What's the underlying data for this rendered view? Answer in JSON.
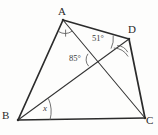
{
  "figure": {
    "kind": "quadrilateral-with-diagonals",
    "background_color": "#fdfdfc",
    "stroke_color": "#2b2b2b",
    "arc_color": "#555555",
    "vertices": [
      {
        "name": "A",
        "label": "A",
        "x": 63,
        "y": 20,
        "label_x": 58,
        "label_y": 6
      },
      {
        "name": "B",
        "label": "B",
        "x": 18,
        "y": 120,
        "label_x": 2,
        "label_y": 110
      },
      {
        "name": "C",
        "label": "C",
        "x": 145,
        "y": 118,
        "label_x": 146,
        "label_y": 115
      },
      {
        "name": "D",
        "label": "D",
        "x": 129,
        "y": 39,
        "label_x": 128,
        "label_y": 24
      }
    ],
    "sides": [
      {
        "name": "side-AB",
        "from": "A",
        "to": "B",
        "width": 1.6
      },
      {
        "name": "side-AD",
        "from": "A",
        "to": "D",
        "width": 1.6
      },
      {
        "name": "side-DC",
        "from": "D",
        "to": "C",
        "width": 1.6
      },
      {
        "name": "side-BC",
        "from": "B",
        "to": "C",
        "width": 1.6
      }
    ],
    "diagonals": [
      {
        "name": "diagonal-AC",
        "from": "A",
        "to": "C",
        "width": 1.0
      },
      {
        "name": "diagonal-BD",
        "from": "B",
        "to": "D",
        "width": 1.0
      }
    ],
    "intersection": {
      "name": "diagonal-intersection",
      "x": 95,
      "y": 60
    },
    "angles": [
      {
        "name": "angle-at-A-BAC",
        "vertex": "A",
        "label": "",
        "marks": 1,
        "tick": true,
        "label_x": 0,
        "label_y": 0
      },
      {
        "name": "angle-51-at-A-DAC",
        "vertex": "A",
        "label": "51°",
        "value": 51,
        "unit": "degrees",
        "marks": 0,
        "tick": false,
        "label_x": 92,
        "label_y": 34
      },
      {
        "name": "angle-85-at-intersection",
        "vertex": "intersection",
        "label": "85°",
        "value": 85,
        "unit": "degrees",
        "marks": 1,
        "tick": false,
        "label_x": 69,
        "label_y": 54
      },
      {
        "name": "angle-at-D-BDC",
        "vertex": "D",
        "label": "",
        "marks": 2,
        "tick": false,
        "label_x": 0,
        "label_y": 0
      },
      {
        "name": "angle-x-at-B-DBC",
        "vertex": "B",
        "label": "x",
        "value": null,
        "unit": "unknown",
        "marks": 1,
        "tick": false,
        "label_x": 43,
        "label_y": 104
      }
    ]
  }
}
